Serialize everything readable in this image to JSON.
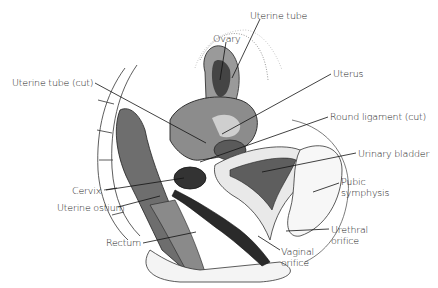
{
  "diagram": {
    "type": "anatomical-illustration",
    "labels": [
      {
        "id": "uterine-tube",
        "text": "Uterine tube",
        "x": 250,
        "y": 10
      },
      {
        "id": "ovary",
        "text": "Ovary",
        "x": 213,
        "y": 33
      },
      {
        "id": "uterus",
        "text": "Uterus",
        "x": 333,
        "y": 71
      },
      {
        "id": "uterine-tube-cut",
        "text": "Uterine tube (cut)",
        "x": 12,
        "y": 77
      },
      {
        "id": "round-ligament-cut",
        "text": "Round ligament (cut)",
        "x": 330,
        "y": 114
      },
      {
        "id": "urinary-bladder",
        "text": "Urinary bladder",
        "x": 358,
        "y": 150
      },
      {
        "id": "pubic-symphysis",
        "line1": "Pubic",
        "line2": "symphysis",
        "x": 341,
        "y": 176
      },
      {
        "id": "cervix",
        "text": "Cervix",
        "x": 72,
        "y": 186
      },
      {
        "id": "uterine-ostium",
        "text": "Uterine ostium",
        "x": 57,
        "y": 203
      },
      {
        "id": "urethral-orifice",
        "line1": "Urethral",
        "line2": "orifice",
        "x": 331,
        "y": 225
      },
      {
        "id": "rectum",
        "text": "Rectum",
        "x": 106,
        "y": 238
      },
      {
        "id": "vaginal-orifice",
        "line1": "Vaginal",
        "line2": "orifice",
        "x": 281,
        "y": 246
      }
    ]
  }
}
